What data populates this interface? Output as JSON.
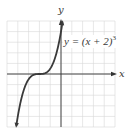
{
  "chart_data": {
    "type": "line",
    "title": "",
    "function": "y = (x + 2)^3",
    "annotation": "y = (x + 2)³",
    "xlabel": "x",
    "ylabel": "y",
    "xlim": [
      -5,
      5
    ],
    "ylim": [
      -10,
      10
    ],
    "grid": true,
    "grid_cells": {
      "x": 10,
      "y": 10
    },
    "x_units_per_cell": 1,
    "y_units_per_cell": 2,
    "legend": "none",
    "series": [
      {
        "name": "y = (x + 2)^3",
        "x": [
          -4.15,
          -4,
          -3.5,
          -3,
          -2.5,
          -2,
          -1.5,
          -1,
          -0.5,
          0,
          0.15
        ],
        "values": [
          -9.94,
          -8,
          -3.375,
          -1,
          -0.125,
          0,
          0.125,
          1,
          3.375,
          8,
          9.94
        ]
      }
    ]
  },
  "labels": {
    "x_axis": "x",
    "y_axis": "y",
    "equation_prefix": "y = (x + 2)",
    "equation_exponent": "3"
  },
  "colors": {
    "curve": "#3a3a3a",
    "axis": "#333333",
    "grid": "#d6d6d6",
    "background": "#ffffff"
  }
}
